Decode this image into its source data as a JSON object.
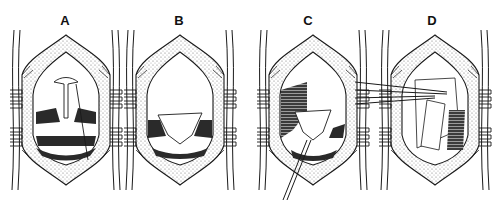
{
  "figure": {
    "panels": [
      {
        "label": "A",
        "description": "Exposed surgical field with retracted tissue, small T-shaped structure at top center"
      },
      {
        "label": "B",
        "description": "Exposed surgical field with triangular flap covering central region"
      },
      {
        "label": "C",
        "description": "Surgical field with hatched tissue on left and instrument entering from lower left"
      },
      {
        "label": "D",
        "description": "Surgical field with graft segments and forceps entering from left"
      }
    ]
  },
  "colors": {
    "line": "#1a1a1a",
    "fill_stipple": "#cfcfcf",
    "fill_dark": "#2a2a2a",
    "background": "#ffffff"
  }
}
